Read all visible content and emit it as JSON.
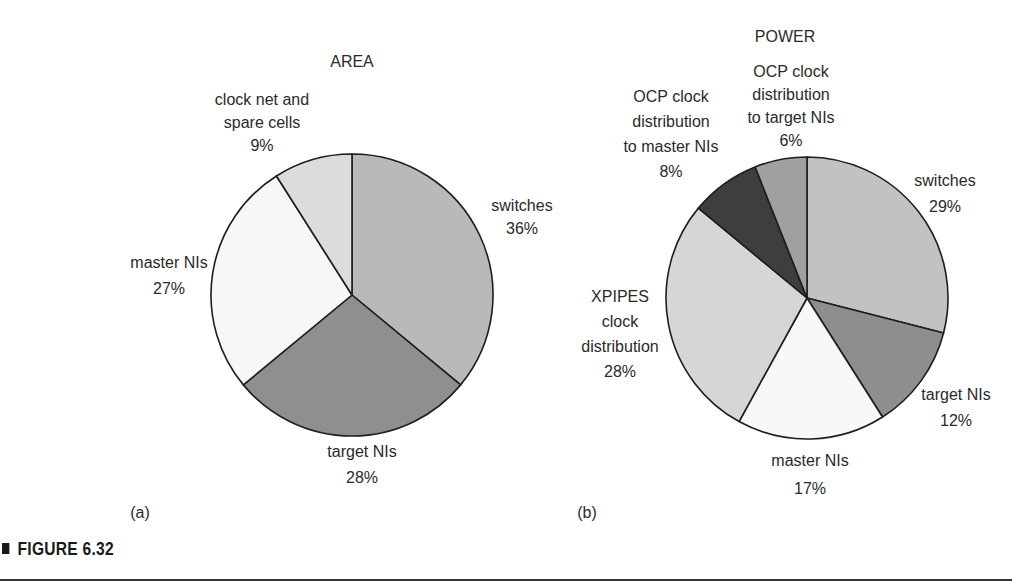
{
  "chart_data": [
    {
      "type": "pie",
      "panel": "(a)",
      "title": "AREA",
      "start_angle": "12 o'clock, clockwise",
      "slices": [
        {
          "label": "switches",
          "value": 36,
          "color": "#b9b9b9"
        },
        {
          "label": "target NIs",
          "value": 28,
          "color": "#8f8f8f"
        },
        {
          "label": "master NIs",
          "value": 27,
          "color": "#f7f7f7"
        },
        {
          "label": "clock net and spare cells",
          "value": 9,
          "color": "#dcdcdc"
        }
      ]
    },
    {
      "type": "pie",
      "panel": "(b)",
      "title": "POWER",
      "start_angle": "12 o'clock, clockwise",
      "slices": [
        {
          "label": "switches",
          "value": 29,
          "color": "#c2c2c2"
        },
        {
          "label": "target NIs",
          "value": 12,
          "color": "#8e8e8e"
        },
        {
          "label": "master NIs",
          "value": 17,
          "color": "#f8f8f8"
        },
        {
          "label": "XPIPES clock distribution",
          "value": 28,
          "color": "#d6d6d6"
        },
        {
          "label": "OCP clock distribution to master NIs",
          "value": 8,
          "color": "#3e3e3e"
        },
        {
          "label": "OCP clock distribution to target NIs",
          "value": 6,
          "color": "#a0a0a0"
        }
      ]
    }
  ],
  "area": {
    "title": "AREA",
    "panel": "(a)",
    "labels": {
      "switches": {
        "l1": "switches",
        "pct": "36%"
      },
      "target": {
        "l1": "target NIs",
        "pct": "28%"
      },
      "master": {
        "l1": "master NIs",
        "pct": "27%"
      },
      "clock": {
        "l1": "clock net and",
        "l2": "spare cells",
        "pct": "9%"
      }
    }
  },
  "power": {
    "title": "POWER",
    "panel": "(b)",
    "labels": {
      "switches": {
        "l1": "switches",
        "pct": "29%"
      },
      "target": {
        "l1": "target NIs",
        "pct": "12%"
      },
      "master": {
        "l1": "master NIs",
        "pct": "17%"
      },
      "xpipes": {
        "l1": "XPIPES",
        "l2": "clock",
        "l3": "distribution",
        "pct": "28%"
      },
      "ocp_master": {
        "l1": "OCP clock",
        "l2": "distribution",
        "l3": "to master NIs",
        "pct": "8%"
      },
      "ocp_target": {
        "l1": "OCP clock",
        "l2": "distribution",
        "l3": "to target NIs",
        "pct": "6%"
      }
    }
  },
  "caption": {
    "text": "FIGURE 6.32"
  }
}
